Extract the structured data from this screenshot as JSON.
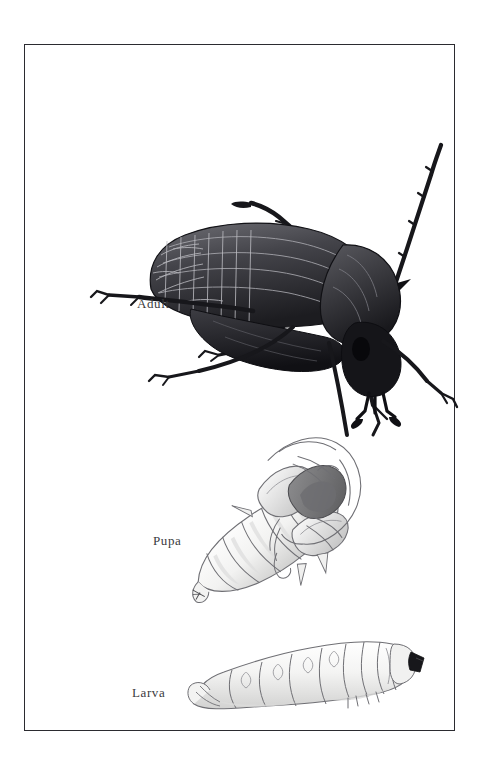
{
  "plate": {
    "title": "Beetle Life Cycle",
    "subject": "longhorn beetle (Cerambycidae)",
    "background_color": "#ffffff",
    "frame": {
      "border_color": "#2b2b30",
      "fill_color": "#ffffff",
      "left": 24,
      "top": 44,
      "width": 431,
      "height": 687
    },
    "label_color": "#3a3a3e"
  },
  "stages": [
    {
      "id": "adult",
      "label": "Adult",
      "description": "dark adult longhorn beetle in three-quarter view, long segmented antennae, reticulated elytra",
      "tone": "dark",
      "label_left": 112,
      "label_top": 251
    },
    {
      "id": "pupa",
      "label": "Pupa",
      "description": "pale exarate pupa oriented diagonally, segmented abdomen with developing wings, legs and antennae",
      "tone": "pale",
      "label_left": 128,
      "label_top": 488
    },
    {
      "id": "larva",
      "label": "Larva",
      "description": "pale legless grub with segmented body and dark sclerotized head capsule at right",
      "tone": "pale",
      "label_left": 107,
      "label_top": 640
    }
  ],
  "palette": {
    "ink_dark": "#1d1d1f",
    "ink_mid": "#4a4a4e",
    "ink_light": "#8d8d92",
    "pale_fill": "#f4f4f3",
    "pale_shade": "#d6d6d6",
    "pale_line": "#6f6f74",
    "white": "#ffffff"
  }
}
